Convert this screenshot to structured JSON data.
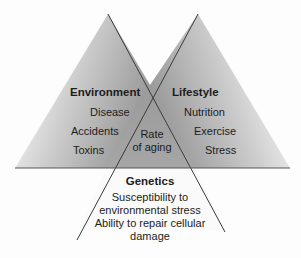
{
  "diagram": {
    "type": "intersecting-triangles",
    "center": {
      "label_line1": "Rate",
      "label_line2": "of aging"
    },
    "environment": {
      "title": "Environment",
      "items": [
        "Disease",
        "Accidents",
        "Toxins"
      ]
    },
    "lifestyle": {
      "title": "Lifestyle",
      "items": [
        "Nutrition",
        "Exercise",
        "Stress"
      ]
    },
    "genetics": {
      "title": "Genetics",
      "lines": [
        "Susceptibility to",
        "environmental stress",
        "Ability to repair cellular",
        "damage"
      ]
    },
    "colors": {
      "shade_dark": "#8f8f8f",
      "shade_light": "#ffffff",
      "line": "#3a3a3a"
    }
  }
}
